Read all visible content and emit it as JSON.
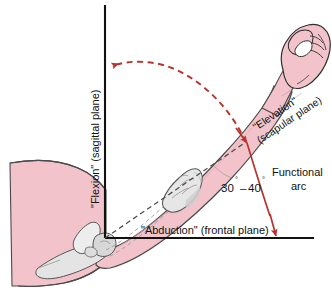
{
  "figure": {
    "labels": {
      "flexion": "\"Flexion\" (sagittal plane)",
      "abduction": "\"Abduction\" (frontal plane)",
      "elevation_line1": "\"Elevation\"",
      "elevation_line2": "(scapular plane)",
      "functional_line1": "Functional",
      "functional_line2": "arc",
      "angle_range": "30°–40°",
      "angle_low": "30",
      "angle_high": "40",
      "degree_symbol": "°",
      "angle_dash": "–"
    },
    "icons": {
      "vertical_axis": "sagittal-axis-line",
      "horizontal_axis": "frontal-axis-line",
      "dashed_arc": "flexion-range-dashed-arc",
      "solid_arc": "functional-arc-curve",
      "arm_axis": "humerus-axis-dashed-line",
      "fist": "closed-fist-hand",
      "scapula": "scapula-bone",
      "humerus_head": "humeral-head-bone",
      "elbow": "elbow-bone",
      "torso": "torso-shoulder-outline"
    },
    "colors": {
      "skin": "#f2c3cb",
      "skin_shadow": "#e8adb8",
      "bone": "#e2e2e2",
      "bone_shadow": "#c2c2c2",
      "outline": "#3a3a3a",
      "axis": "#111111",
      "accent_red": "#c0392b",
      "arc_red": "#b8332c",
      "text": "#111111"
    }
  }
}
